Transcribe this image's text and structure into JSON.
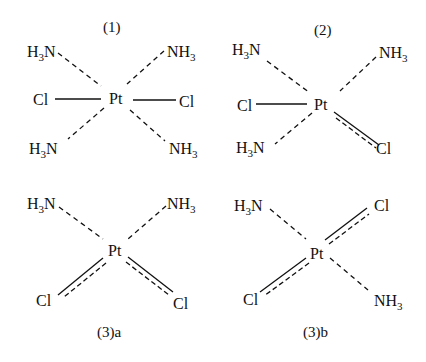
{
  "diagram": {
    "type": "chemical-structures",
    "structures": [
      {
        "id": "1",
        "label": "(1)",
        "center": "Pt",
        "ligands": {
          "top_left": {
            "pre": "H",
            "sub": "3",
            "post": "N"
          },
          "top_right": {
            "pre": "NH",
            "sub": "3",
            "post": ""
          },
          "left": "Cl",
          "right": "Cl",
          "bottom_left": {
            "pre": "H",
            "sub": "3",
            "post": "N"
          },
          "bottom_right": {
            "pre": "NH",
            "sub": "3",
            "post": ""
          }
        },
        "bonds": {
          "top_left": "dashed",
          "top_right": "dashed",
          "left": "solid",
          "right": "solid",
          "bottom_left": "dashed",
          "bottom_right": "dashed"
        }
      },
      {
        "id": "2",
        "label": "(2)",
        "center": "Pt",
        "ligands": {
          "top_left": {
            "pre": "H",
            "sub": "3",
            "post": "N"
          },
          "top_right": {
            "pre": "NH",
            "sub": "3",
            "post": ""
          },
          "left": "Cl",
          "bottom_left": {
            "pre": "H",
            "sub": "3",
            "post": "N"
          },
          "bottom_right": "Cl"
        },
        "bonds": {
          "top_left": "dashed",
          "top_right": "dashed",
          "left": "solid",
          "bottom_left": "dashed",
          "bottom_right": "solid+dashed"
        }
      },
      {
        "id": "3a",
        "label": "(3)a",
        "center": "Pt",
        "ligands": {
          "top_left": {
            "pre": "H",
            "sub": "3",
            "post": "N"
          },
          "top_right": {
            "pre": "NH",
            "sub": "3",
            "post": ""
          },
          "bottom_left": "Cl",
          "bottom_right": "Cl"
        },
        "bonds": {
          "top_left": "dashed",
          "top_right": "dashed",
          "bottom_left": "solid+dashed",
          "bottom_right": "solid+dashed"
        }
      },
      {
        "id": "3b",
        "label": "(3)b",
        "center": "Pt",
        "ligands": {
          "top_left": {
            "pre": "H",
            "sub": "3",
            "post": "N"
          },
          "top_right": "Cl",
          "bottom_left": "Cl",
          "bottom_right": {
            "pre": "NH",
            "sub": "3",
            "post": ""
          }
        },
        "bonds": {
          "top_left": "dashed",
          "top_right": "solid+dashed",
          "bottom_left": "solid+dashed",
          "bottom_right": "dashed"
        }
      }
    ]
  },
  "colors": {
    "ink": "#111111",
    "background": "#ffffff"
  }
}
